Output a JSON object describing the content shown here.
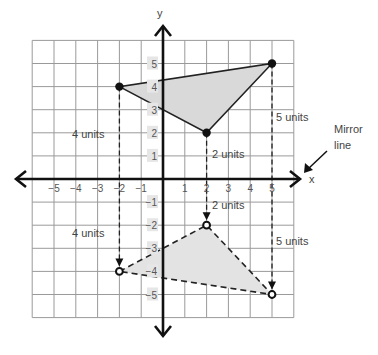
{
  "diagram": {
    "axes": {
      "x_label": "x",
      "y_label": "y",
      "x_ticks": [
        "-5",
        "-4",
        "-3",
        "-2",
        "-1",
        "1",
        "2",
        "3",
        "4",
        "5"
      ],
      "y_ticks": [
        "5",
        "4",
        "3",
        "2",
        "1",
        "-1",
        "-2",
        "-3",
        "-4",
        "-5"
      ],
      "x_range": [
        -6,
        6
      ],
      "y_range": [
        -6,
        6
      ]
    },
    "original_triangle": {
      "vertices": [
        [
          -2,
          4
        ],
        [
          2,
          2
        ],
        [
          5,
          5
        ]
      ],
      "style": "solid",
      "fill": "#d9d9d9"
    },
    "image_triangle": {
      "vertices": [
        [
          -2,
          -4
        ],
        [
          2,
          -2
        ],
        [
          5,
          -5
        ]
      ],
      "style": "dashed",
      "fill": "#e3e3e3"
    },
    "distance_labels": [
      {
        "text": "4 units",
        "side": "above",
        "x": -2
      },
      {
        "text": "4 units",
        "side": "below",
        "x": -2
      },
      {
        "text": "2 units",
        "side": "above",
        "x": 2
      },
      {
        "text": "2 units",
        "side": "below",
        "x": 2
      },
      {
        "text": "5 units",
        "side": "above",
        "x": 5
      },
      {
        "text": "5 units",
        "side": "below",
        "x": 5
      }
    ],
    "mirror_label": [
      "Mirror",
      "line"
    ]
  }
}
